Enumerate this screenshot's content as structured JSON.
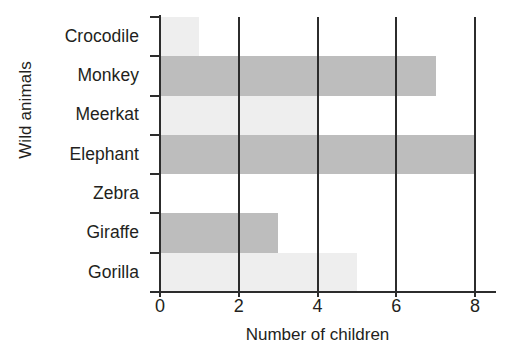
{
  "chart_data": {
    "type": "bar",
    "orientation": "horizontal",
    "title": "",
    "xlabel": "Number of children",
    "ylabel": "Wild animals",
    "categories": [
      "Crocodile",
      "Monkey",
      "Meerkat",
      "Elephant",
      "Zebra",
      "Giraffe",
      "Gorilla"
    ],
    "values": [
      1,
      7,
      4,
      8,
      0,
      3,
      5
    ],
    "xlim": [
      0,
      8
    ],
    "xticks": [
      0,
      2,
      4,
      6,
      8
    ],
    "xtick_labels": [
      "0",
      "2",
      "4",
      "6",
      "8"
    ],
    "grid": "vertical-gridlines-at-xticks",
    "legend": "none",
    "bar_colors": [
      "#eeeeee",
      "#bdbdbd",
      "#eeeeee",
      "#bdbdbd",
      "#eeeeee",
      "#bdbdbd",
      "#eeeeee"
    ],
    "axis_color": "#2c2c2c"
  },
  "colors": {
    "bar_light": "#eeeeee",
    "bar_dark": "#bdbdbd",
    "axis": "#2c2c2c",
    "text": "#231f20",
    "background": "#ffffff"
  }
}
